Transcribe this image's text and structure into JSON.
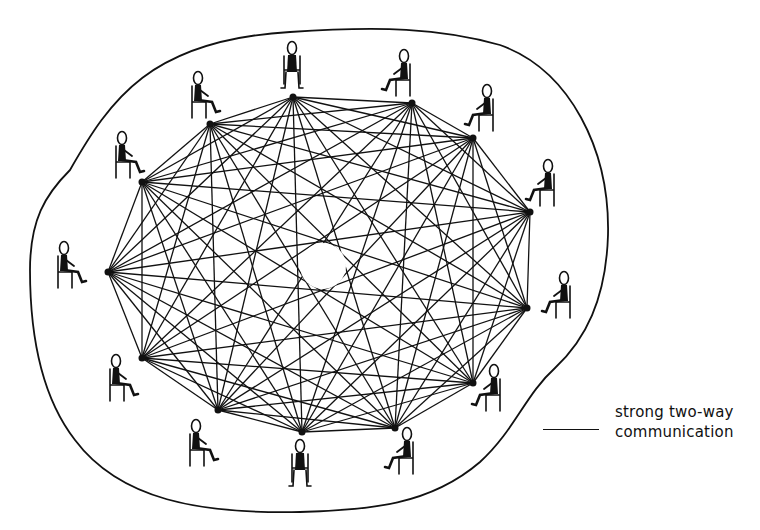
{
  "diagram": {
    "colors": {
      "line": "#111111",
      "background": "#ffffff"
    },
    "boundary_path": "M 70 170 C 110 100, 150 40, 290 32 C 380 26, 440 28, 500 45 C 570 70, 610 150, 608 235 C 606 300, 585 340, 555 368 C 525 395, 515 430, 480 462 C 430 505, 370 510, 300 512 C 200 514, 120 500, 75 440 C 40 395, 30 330, 30 270 C 30 220, 45 195, 70 170 Z",
    "center_hole": {
      "cx": 323,
      "cy": 266,
      "r": 23
    },
    "nodes": [
      {
        "id": "p1",
        "x": 293,
        "y": 97,
        "person": {
          "x": 292,
          "y": 62,
          "facing": "front"
        }
      },
      {
        "id": "p2",
        "x": 412,
        "y": 103,
        "person": {
          "x": 402,
          "y": 70,
          "facing": "left"
        }
      },
      {
        "id": "p3",
        "x": 473,
        "y": 138,
        "person": {
          "x": 485,
          "y": 105,
          "facing": "left"
        }
      },
      {
        "id": "p4",
        "x": 530,
        "y": 212,
        "person": {
          "x": 546,
          "y": 180,
          "facing": "left"
        }
      },
      {
        "id": "p5",
        "x": 527,
        "y": 308,
        "person": {
          "x": 562,
          "y": 292,
          "facing": "left"
        }
      },
      {
        "id": "p6",
        "x": 473,
        "y": 383,
        "person": {
          "x": 492,
          "y": 385,
          "facing": "left"
        }
      },
      {
        "id": "p7",
        "x": 395,
        "y": 428,
        "person": {
          "x": 405,
          "y": 448,
          "facing": "left"
        }
      },
      {
        "id": "p8",
        "x": 302,
        "y": 432,
        "person": {
          "x": 300,
          "y": 460,
          "facing": "front"
        }
      },
      {
        "id": "p9",
        "x": 218,
        "y": 410,
        "person": {
          "x": 198,
          "y": 440,
          "facing": "right"
        }
      },
      {
        "id": "p10",
        "x": 142,
        "y": 358,
        "person": {
          "x": 118,
          "y": 375,
          "facing": "right"
        }
      },
      {
        "id": "p11",
        "x": 108,
        "y": 272,
        "person": {
          "x": 66,
          "y": 262,
          "facing": "right"
        }
      },
      {
        "id": "p12",
        "x": 142,
        "y": 182,
        "person": {
          "x": 124,
          "y": 152,
          "facing": "right"
        }
      },
      {
        "id": "p13",
        "x": 210,
        "y": 124,
        "person": {
          "x": 200,
          "y": 92,
          "facing": "right"
        }
      }
    ]
  },
  "legend": {
    "line_label_1": "strong two-way",
    "line_label_2": "communication"
  }
}
